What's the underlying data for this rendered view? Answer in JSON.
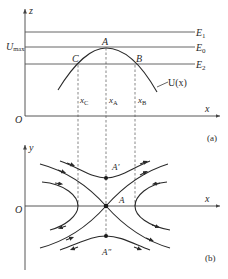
{
  "figure": {
    "panel_a": {
      "label": "(a)",
      "vertical_axis_label": "z",
      "horizontal_axis_label": "x",
      "origin_label": "O",
      "umax_label": "U",
      "umax_sub": "max",
      "energy_levels": [
        {
          "label": "E",
          "sub": "1"
        },
        {
          "label": "E",
          "sub": "0"
        },
        {
          "label": "E",
          "sub": "2"
        }
      ],
      "points": {
        "A": "A",
        "B": "B",
        "C": "C"
      },
      "curve_label": "U(x)",
      "x_marks": [
        {
          "label": "x",
          "sub": "C"
        },
        {
          "label": "x",
          "sub": "A"
        },
        {
          "label": "x",
          "sub": "B"
        }
      ]
    },
    "panel_b": {
      "label": "(b)",
      "vertical_axis_label": "y",
      "horizontal_axis_label": "x",
      "origin_label": "O",
      "points": {
        "A": "A",
        "A_prime": "A′",
        "A_double_prime": "A″"
      }
    }
  }
}
